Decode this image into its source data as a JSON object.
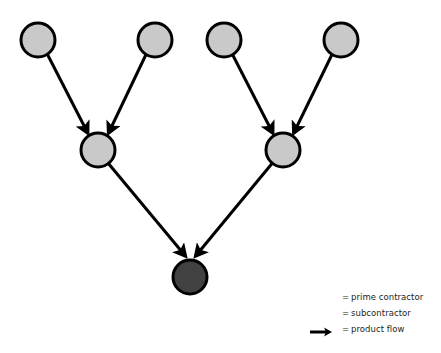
{
  "diagram": {
    "background_color": "#ffffff",
    "colors": {
      "subcontractor_fill": "#c9c9c9",
      "prime_contractor_fill": "#414141",
      "node_stroke": "#000000",
      "edge_color": "#000000",
      "text_color": "#231f20"
    },
    "node_radius": 17,
    "node_stroke_width": 3,
    "edge_stroke_width": 3,
    "nodes": [
      {
        "id": "sub-top-1",
        "role": "subcontractor",
        "cx": 38,
        "cy": 40,
        "fill": "#c9c9c9"
      },
      {
        "id": "sub-top-2",
        "role": "subcontractor",
        "cx": 155,
        "cy": 40,
        "fill": "#c9c9c9"
      },
      {
        "id": "sub-top-3",
        "role": "subcontractor",
        "cx": 224,
        "cy": 40,
        "fill": "#c9c9c9"
      },
      {
        "id": "sub-top-4",
        "role": "subcontractor",
        "cx": 341,
        "cy": 40,
        "fill": "#c9c9c9"
      },
      {
        "id": "sub-mid-left",
        "role": "subcontractor",
        "cx": 98,
        "cy": 150,
        "fill": "#c9c9c9"
      },
      {
        "id": "sub-mid-right",
        "role": "subcontractor",
        "cx": 283,
        "cy": 150,
        "fill": "#c9c9c9"
      },
      {
        "id": "prime",
        "role": "prime contractor",
        "cx": 190,
        "cy": 277,
        "fill": "#414141"
      }
    ],
    "edges": [
      {
        "id": "edge-1",
        "from": "sub-top-1",
        "to": "sub-mid-left"
      },
      {
        "id": "edge-2",
        "from": "sub-top-2",
        "to": "sub-mid-left"
      },
      {
        "id": "edge-3",
        "from": "sub-top-3",
        "to": "sub-mid-right"
      },
      {
        "id": "edge-4",
        "from": "sub-top-4",
        "to": "sub-mid-right"
      },
      {
        "id": "edge-5",
        "from": "sub-mid-left",
        "to": "prime"
      },
      {
        "id": "edge-6",
        "from": "sub-mid-right",
        "to": "prime"
      }
    ]
  },
  "legend": {
    "equals_sign": "=",
    "items": [
      {
        "marker": "dark-circle-marker",
        "label": "prime contractor",
        "color": "#4a4a4a"
      },
      {
        "marker": "light-circle-marker",
        "label": "subcontractor",
        "color": "#b3b3b3"
      },
      {
        "marker": "arrow-marker",
        "label": "product flow",
        "color": "#000000"
      }
    ]
  }
}
